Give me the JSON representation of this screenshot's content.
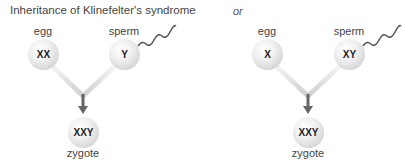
{
  "title": "Inheritance of Klinefelter's syndrome",
  "separator": "or",
  "diagrams": [
    {
      "egg": {
        "label": "egg",
        "chromosomes": "XX"
      },
      "sperm": {
        "label": "sperm",
        "chromosomes": "Y"
      },
      "zygote": {
        "label": "zygote",
        "chromosomes": "XXY"
      }
    },
    {
      "egg": {
        "label": "egg",
        "chromosomes": "X"
      },
      "sperm": {
        "label": "sperm",
        "chromosomes": "XY"
      },
      "zygote": {
        "label": "zygote",
        "chromosomes": "XXY"
      }
    }
  ],
  "colors": {
    "cell": "#e0e0e0",
    "arrow": "#666666",
    "path": "#d8d8d8",
    "tail": "#555555"
  }
}
